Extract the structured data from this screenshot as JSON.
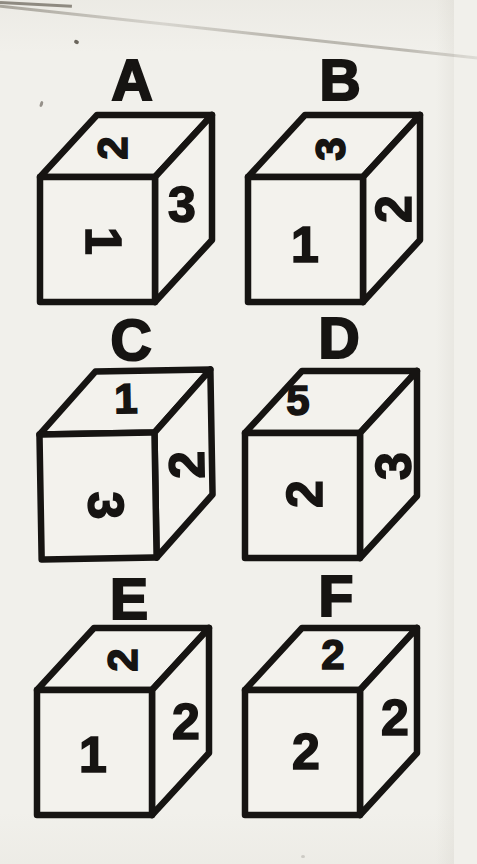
{
  "page": {
    "paper_color": "#f1f0eb",
    "ink_color": "#161412"
  },
  "cubes": [
    {
      "label": "A",
      "faces": {
        "top": {
          "value": "2",
          "rotation": -90
        },
        "front": {
          "value": "1",
          "rotation": 90
        },
        "right": {
          "value": "3",
          "rotation": 0
        }
      }
    },
    {
      "label": "B",
      "faces": {
        "top": {
          "value": "3",
          "rotation": -90
        },
        "front": {
          "value": "1",
          "rotation": 0
        },
        "right": {
          "value": "2",
          "rotation": -90
        }
      }
    },
    {
      "label": "C",
      "faces": {
        "top": {
          "value": "1",
          "rotation": 0
        },
        "front": {
          "value": "3",
          "rotation": 90
        },
        "right": {
          "value": "2",
          "rotation": -90
        }
      }
    },
    {
      "label": "D",
      "faces": {
        "top": {
          "value": "5",
          "rotation": 0
        },
        "front": {
          "value": "2",
          "rotation": -90
        },
        "right": {
          "value": "3",
          "rotation": -90
        }
      }
    },
    {
      "label": "E",
      "faces": {
        "top": {
          "value": "2",
          "rotation": -90
        },
        "front": {
          "value": "1",
          "rotation": 0
        },
        "right": {
          "value": "2",
          "rotation": 0
        }
      }
    },
    {
      "label": "F",
      "faces": {
        "top": {
          "value": "2",
          "rotation": 0
        },
        "front": {
          "value": "2",
          "rotation": 0
        },
        "right": {
          "value": "2",
          "rotation": 0
        }
      }
    }
  ]
}
